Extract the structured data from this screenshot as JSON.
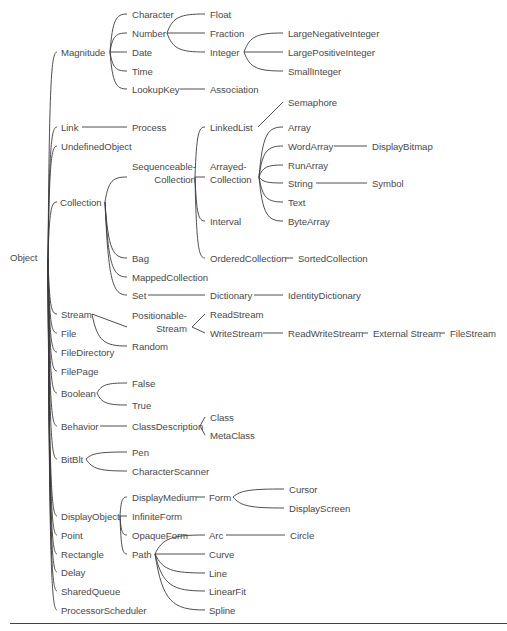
{
  "diagram": {
    "root": "Object",
    "line_color": "#3a3a3a",
    "text_color": "#4a4a4a",
    "nodes": [
      {
        "id": "Object",
        "label": "Object",
        "x": 10,
        "y": 252,
        "ax": 46,
        "ay": 258
      },
      {
        "id": "Magnitude",
        "label": "Magnitude",
        "x": 61,
        "y": 47,
        "lx": 58,
        "rx": 108,
        "ay": 52
      },
      {
        "id": "Character",
        "label": "Character",
        "x": 132,
        "y": 9,
        "lx": 128,
        "rx": 176,
        "ay": 14
      },
      {
        "id": "Number",
        "label": "Number",
        "x": 132,
        "y": 28,
        "lx": 128,
        "rx": 165,
        "ay": 33
      },
      {
        "id": "Date",
        "label": "Date",
        "x": 132,
        "y": 47,
        "lx": 128,
        "rx": 152,
        "ay": 52
      },
      {
        "id": "Time",
        "label": "Time",
        "x": 132,
        "y": 66,
        "lx": 128,
        "rx": 152,
        "ay": 71
      },
      {
        "id": "LookupKey",
        "label": "LookupKey",
        "x": 132,
        "y": 84,
        "lx": 128,
        "rx": 178,
        "ay": 89
      },
      {
        "id": "Float",
        "label": "Float",
        "x": 210,
        "y": 9,
        "lx": 206,
        "rx": 236,
        "ay": 14
      },
      {
        "id": "Fraction",
        "label": "Fraction",
        "x": 210,
        "y": 28,
        "lx": 206,
        "rx": 245,
        "ay": 33
      },
      {
        "id": "Integer",
        "label": "Integer",
        "x": 210,
        "y": 47,
        "lx": 206,
        "rx": 242,
        "ay": 52
      },
      {
        "id": "Association",
        "label": "Association",
        "x": 210,
        "y": 84,
        "lx": 206,
        "rx": 258,
        "ay": 89
      },
      {
        "id": "LargeNegativeInteger",
        "label": "LargeNegativeInteger",
        "x": 288,
        "y": 28,
        "lx": 284,
        "rx": 380,
        "ay": 33
      },
      {
        "id": "LargePositiveInteger",
        "label": "LargePositiveInteger",
        "x": 288,
        "y": 47,
        "lx": 284,
        "rx": 380,
        "ay": 52
      },
      {
        "id": "SmallInteger",
        "label": "SmallInteger",
        "x": 288,
        "y": 66,
        "lx": 284,
        "rx": 340,
        "ay": 71
      },
      {
        "id": "Link",
        "label": "Link",
        "x": 61,
        "y": 122,
        "lx": 58,
        "rx": 80,
        "ay": 127
      },
      {
        "id": "Process",
        "label": "Process",
        "x": 132,
        "y": 122,
        "lx": 128,
        "rx": 165,
        "ay": 127
      },
      {
        "id": "UndefinedObject",
        "label": "UndefinedObject",
        "x": 61,
        "y": 141,
        "lx": 58,
        "rx": 130,
        "ay": 146
      },
      {
        "id": "Collection",
        "label": "Collection",
        "x": 60,
        "y": 197,
        "lx": 58,
        "rx": 103,
        "ay": 202
      },
      {
        "id": "SequenceableCollection",
        "label": "Sequenceable-",
        "label2": "Collection",
        "x": 132,
        "y": 160,
        "lx": 128,
        "rx": 193,
        "ay": 177,
        "two": true,
        "align2": "right"
      },
      {
        "id": "Bag",
        "label": "Bag",
        "x": 132,
        "y": 253,
        "lx": 128,
        "rx": 148,
        "ay": 258
      },
      {
        "id": "MappedCollection",
        "label": "MappedCollection",
        "x": 132,
        "y": 272,
        "lx": 128,
        "rx": 205,
        "ay": 277
      },
      {
        "id": "Set",
        "label": "Set",
        "x": 132,
        "y": 290,
        "lx": 128,
        "rx": 146,
        "ay": 295
      },
      {
        "id": "LinkedList",
        "label": "LinkedList",
        "x": 210,
        "y": 122,
        "lx": 206,
        "rx": 256,
        "ay": 127
      },
      {
        "id": "ArrayedCollection",
        "label": "Arrayed-",
        "label2": "Collection",
        "x": 210,
        "y": 160,
        "lx": 206,
        "rx": 257,
        "ay": 177,
        "two": true,
        "align2": "right"
      },
      {
        "id": "Interval",
        "label": "Interval",
        "x": 210,
        "y": 216,
        "lx": 206,
        "rx": 242,
        "ay": 221
      },
      {
        "id": "OrderedCollection",
        "label": "OrderedCollection",
        "x": 210,
        "y": 253,
        "lx": 206,
        "rx": 283,
        "ay": 258
      },
      {
        "id": "Dictionary",
        "label": "Dictionary",
        "x": 210,
        "y": 290,
        "lx": 206,
        "rx": 252,
        "ay": 295
      },
      {
        "id": "Semaphore",
        "label": "Semaphore",
        "x": 288,
        "y": 97,
        "lx": 284,
        "rx": 335,
        "ay": 102
      },
      {
        "id": "Array",
        "label": "Array",
        "x": 288,
        "y": 122,
        "lx": 284,
        "rx": 310,
        "ay": 127
      },
      {
        "id": "WordArray",
        "label": "WordArray",
        "x": 288,
        "y": 141,
        "lx": 284,
        "rx": 332,
        "ay": 146
      },
      {
        "id": "RunArray",
        "label": "RunArray",
        "x": 288,
        "y": 160,
        "lx": 284,
        "rx": 326,
        "ay": 165
      },
      {
        "id": "String",
        "label": "String",
        "x": 288,
        "y": 178,
        "lx": 284,
        "rx": 314,
        "ay": 183
      },
      {
        "id": "Text",
        "label": "Text",
        "x": 288,
        "y": 197,
        "lx": 284,
        "rx": 306,
        "ay": 202
      },
      {
        "id": "ByteArray",
        "label": "ByteArray",
        "x": 288,
        "y": 216,
        "lx": 284,
        "rx": 330,
        "ay": 221
      },
      {
        "id": "SortedCollection",
        "label": "SortedCollection",
        "x": 298,
        "y": 253,
        "lx": 294,
        "rx": 368,
        "ay": 258
      },
      {
        "id": "IdentityDictionary",
        "label": "IdentityDictionary",
        "x": 288,
        "y": 290,
        "lx": 284,
        "rx": 366,
        "ay": 295
      },
      {
        "id": "DisplayBitmap",
        "label": "DisplayBitmap",
        "x": 372,
        "y": 141,
        "lx": 368,
        "rx": 430,
        "ay": 146
      },
      {
        "id": "Symbol",
        "label": "Symbol",
        "x": 372,
        "y": 178,
        "lx": 368,
        "rx": 402,
        "ay": 183
      },
      {
        "id": "Stream",
        "label": "Stream",
        "x": 61,
        "y": 309,
        "lx": 58,
        "rx": 90,
        "ay": 314
      },
      {
        "id": "PositionableStream",
        "label": "Positionable-",
        "label2": "Stream",
        "x": 132,
        "y": 309,
        "lx": 128,
        "rx": 190,
        "ay": 327,
        "two": true,
        "align2": "right"
      },
      {
        "id": "Random",
        "label": "Random",
        "x": 132,
        "y": 341,
        "lx": 128,
        "rx": 165,
        "ay": 346
      },
      {
        "id": "ReadStream",
        "label": "ReadStream",
        "x": 210,
        "y": 309,
        "lx": 206,
        "rx": 258,
        "ay": 314
      },
      {
        "id": "WriteStream",
        "label": "WriteStream",
        "x": 210,
        "y": 328,
        "lx": 206,
        "rx": 261,
        "ay": 333
      },
      {
        "id": "ReadWriteStream",
        "label": "ReadWriteStream",
        "x": 288,
        "y": 328,
        "lx": 284,
        "rx": 360,
        "ay": 333
      },
      {
        "id": "ExternalStream",
        "label": "External Stream",
        "x": 373,
        "y": 328,
        "lx": 369,
        "rx": 438,
        "ay": 333
      },
      {
        "id": "FileStream",
        "label": "FileStream",
        "x": 450,
        "y": 328,
        "lx": 446,
        "rx": 498,
        "ay": 333
      },
      {
        "id": "File",
        "label": "File",
        "x": 61,
        "y": 328,
        "lx": 58,
        "rx": 76,
        "ay": 333
      },
      {
        "id": "FileDirectory",
        "label": "FileDirectory",
        "x": 61,
        "y": 347,
        "lx": 58,
        "rx": 116,
        "ay": 352
      },
      {
        "id": "FilePage",
        "label": "FilePage",
        "x": 61,
        "y": 366,
        "lx": 58,
        "rx": 98,
        "ay": 371
      },
      {
        "id": "Boolean",
        "label": "Boolean",
        "x": 61,
        "y": 388,
        "lx": 58,
        "rx": 95,
        "ay": 393
      },
      {
        "id": "False",
        "label": "False",
        "x": 132,
        "y": 378,
        "lx": 128,
        "rx": 152,
        "ay": 383
      },
      {
        "id": "True",
        "label": "True",
        "x": 132,
        "y": 400,
        "lx": 128,
        "rx": 150,
        "ay": 405
      },
      {
        "id": "Behavior",
        "label": "Behavior",
        "x": 61,
        "y": 421,
        "lx": 58,
        "rx": 98,
        "ay": 426
      },
      {
        "id": "ClassDescription",
        "label": "ClassDescription",
        "x": 132,
        "y": 421,
        "lx": 128,
        "rx": 198,
        "ay": 426
      },
      {
        "id": "Class",
        "label": "Class",
        "x": 210,
        "y": 412,
        "lx": 206,
        "rx": 232,
        "ay": 417
      },
      {
        "id": "MetaClass",
        "label": "MetaClass",
        "x": 210,
        "y": 430,
        "lx": 206,
        "rx": 252,
        "ay": 435
      },
      {
        "id": "BitBlt",
        "label": "BitBlt",
        "x": 61,
        "y": 454,
        "lx": 58,
        "rx": 84,
        "ay": 459
      },
      {
        "id": "Pen",
        "label": "Pen",
        "x": 132,
        "y": 447,
        "lx": 128,
        "rx": 148,
        "ay": 452
      },
      {
        "id": "CharacterScanner",
        "label": "CharacterScanner",
        "x": 132,
        "y": 466,
        "lx": 128,
        "rx": 202,
        "ay": 471
      },
      {
        "id": "DisplayObject",
        "label": "DisplayObject",
        "x": 61,
        "y": 511,
        "lx": 58,
        "rx": 118,
        "ay": 516
      },
      {
        "id": "DisplayMedium",
        "label": "DisplayMedium",
        "x": 132,
        "y": 492,
        "lx": 128,
        "rx": 194,
        "ay": 497
      },
      {
        "id": "InfiniteForm",
        "label": "InfiniteForm",
        "x": 132,
        "y": 511,
        "lx": 128,
        "rx": 180,
        "ay": 516
      },
      {
        "id": "OpaqueForm",
        "label": "OpaqueForm",
        "x": 132,
        "y": 530,
        "lx": 128,
        "rx": 184,
        "ay": 535
      },
      {
        "id": "Path",
        "label": "Path",
        "x": 132,
        "y": 549,
        "lx": 128,
        "rx": 153,
        "ay": 554
      },
      {
        "id": "Form",
        "label": "Form",
        "x": 209,
        "y": 492,
        "lx": 206,
        "rx": 231,
        "ay": 497
      },
      {
        "id": "Cursor",
        "label": "Cursor",
        "x": 289,
        "y": 484,
        "lx": 285,
        "rx": 316,
        "ay": 489
      },
      {
        "id": "DisplayScreen",
        "label": "DisplayScreen",
        "x": 289,
        "y": 503,
        "lx": 285,
        "rx": 348,
        "ay": 508
      },
      {
        "id": "Arc",
        "label": "Arc",
        "x": 209,
        "y": 530,
        "lx": 206,
        "rx": 224,
        "ay": 535
      },
      {
        "id": "Circle",
        "label": "Circle",
        "x": 290,
        "y": 530,
        "lx": 286,
        "rx": 314,
        "ay": 535
      },
      {
        "id": "Curve",
        "label": "Curve",
        "x": 209,
        "y": 549,
        "lx": 206,
        "rx": 234,
        "ay": 554
      },
      {
        "id": "Line",
        "label": "Line",
        "x": 209,
        "y": 568,
        "lx": 206,
        "rx": 226,
        "ay": 573
      },
      {
        "id": "LinearFit",
        "label": "LinearFit",
        "x": 209,
        "y": 586,
        "lx": 206,
        "rx": 248,
        "ay": 591
      },
      {
        "id": "Spline",
        "label": "Spline",
        "x": 209,
        "y": 605,
        "lx": 206,
        "rx": 236,
        "ay": 610
      },
      {
        "id": "Point",
        "label": "Point",
        "x": 61,
        "y": 530,
        "lx": 58,
        "rx": 84,
        "ay": 535
      },
      {
        "id": "Rectangle",
        "label": "Rectangle",
        "x": 61,
        "y": 549,
        "lx": 58,
        "rx": 104,
        "ay": 554
      },
      {
        "id": "Delay",
        "label": "Delay",
        "x": 61,
        "y": 567,
        "lx": 58,
        "rx": 84,
        "ay": 572
      },
      {
        "id": "SharedQueue",
        "label": "SharedQueue",
        "x": 61,
        "y": 586,
        "lx": 58,
        "rx": 115,
        "ay": 591
      },
      {
        "id": "ProcessorScheduler",
        "label": "ProcessorScheduler",
        "x": 61,
        "y": 605,
        "lx": 58,
        "rx": 145,
        "ay": 610
      }
    ],
    "edges": [
      [
        "Object",
        "Magnitude",
        "curve"
      ],
      [
        "Object",
        "Link",
        "curve"
      ],
      [
        "Object",
        "UndefinedObject",
        "curve"
      ],
      [
        "Object",
        "Collection",
        "curve"
      ],
      [
        "Object",
        "Stream",
        "curve"
      ],
      [
        "Object",
        "File",
        "curve"
      ],
      [
        "Object",
        "FileDirectory",
        "curve"
      ],
      [
        "Object",
        "FilePage",
        "curve"
      ],
      [
        "Object",
        "Boolean",
        "curve"
      ],
      [
        "Object",
        "Behavior",
        "curve"
      ],
      [
        "Object",
        "BitBlt",
        "curve"
      ],
      [
        "Object",
        "DisplayObject",
        "curve"
      ],
      [
        "Object",
        "Point",
        "curve"
      ],
      [
        "Object",
        "Rectangle",
        "curve"
      ],
      [
        "Object",
        "Delay",
        "curve"
      ],
      [
        "Object",
        "SharedQueue",
        "curve"
      ],
      [
        "Object",
        "ProcessorScheduler",
        "curve"
      ],
      [
        "Magnitude",
        "Character",
        "curve"
      ],
      [
        "Magnitude",
        "Number",
        "curve"
      ],
      [
        "Magnitude",
        "Date",
        "curve"
      ],
      [
        "Magnitude",
        "Time",
        "curve"
      ],
      [
        "Magnitude",
        "LookupKey",
        "curve"
      ],
      [
        "Number",
        "Float",
        "curve"
      ],
      [
        "Number",
        "Fraction",
        "curve"
      ],
      [
        "Number",
        "Integer",
        "curve"
      ],
      [
        "Integer",
        "LargeNegativeInteger",
        "curve"
      ],
      [
        "Integer",
        "LargePositiveInteger",
        "curve"
      ],
      [
        "Integer",
        "SmallInteger",
        "curve"
      ],
      [
        "LookupKey",
        "Association",
        "line"
      ],
      [
        "Link",
        "Process",
        "line"
      ],
      [
        "Collection",
        "SequenceableCollection",
        "curve"
      ],
      [
        "Collection",
        "Bag",
        "curve"
      ],
      [
        "Collection",
        "MappedCollection",
        "curve"
      ],
      [
        "Collection",
        "Set",
        "curve"
      ],
      [
        "SequenceableCollection",
        "LinkedList",
        "curve"
      ],
      [
        "SequenceableCollection",
        "ArrayedCollection",
        "curve"
      ],
      [
        "SequenceableCollection",
        "Interval",
        "curve"
      ],
      [
        "SequenceableCollection",
        "OrderedCollection",
        "curve"
      ],
      [
        "LinkedList",
        "Semaphore",
        "line"
      ],
      [
        "ArrayedCollection",
        "Array",
        "curve"
      ],
      [
        "ArrayedCollection",
        "WordArray",
        "curve"
      ],
      [
        "ArrayedCollection",
        "RunArray",
        "curve"
      ],
      [
        "ArrayedCollection",
        "String",
        "curve"
      ],
      [
        "ArrayedCollection",
        "Text",
        "curve"
      ],
      [
        "ArrayedCollection",
        "ByteArray",
        "curve"
      ],
      [
        "WordArray",
        "DisplayBitmap",
        "line"
      ],
      [
        "String",
        "Symbol",
        "line"
      ],
      [
        "OrderedCollection",
        "SortedCollection",
        "line"
      ],
      [
        "Set",
        "Dictionary",
        "line"
      ],
      [
        "Dictionary",
        "IdentityDictionary",
        "line"
      ],
      [
        "Stream",
        "PositionableStream",
        "line"
      ],
      [
        "Stream",
        "Random",
        "curve"
      ],
      [
        "PositionableStream",
        "ReadStream",
        "line"
      ],
      [
        "PositionableStream",
        "WriteStream",
        "line"
      ],
      [
        "WriteStream",
        "ReadWriteStream",
        "line"
      ],
      [
        "ReadWriteStream",
        "ExternalStream",
        "line"
      ],
      [
        "ExternalStream",
        "FileStream",
        "line"
      ],
      [
        "Boolean",
        "False",
        "curve"
      ],
      [
        "Boolean",
        "True",
        "curve"
      ],
      [
        "Behavior",
        "ClassDescription",
        "line"
      ],
      [
        "ClassDescription",
        "Class",
        "line"
      ],
      [
        "ClassDescription",
        "MetaClass",
        "line"
      ],
      [
        "BitBlt",
        "Pen",
        "curve"
      ],
      [
        "BitBlt",
        "CharacterScanner",
        "curve"
      ],
      [
        "DisplayObject",
        "DisplayMedium",
        "curve"
      ],
      [
        "DisplayObject",
        "InfiniteForm",
        "curve"
      ],
      [
        "DisplayObject",
        "OpaqueForm",
        "curve"
      ],
      [
        "DisplayObject",
        "Path",
        "curve"
      ],
      [
        "DisplayMedium",
        "Form",
        "line"
      ],
      [
        "Form",
        "Cursor",
        "curve"
      ],
      [
        "Form",
        "DisplayScreen",
        "curve"
      ],
      [
        "Path",
        "Arc",
        "curve"
      ],
      [
        "Path",
        "Curve",
        "curve"
      ],
      [
        "Path",
        "Line",
        "curve"
      ],
      [
        "Path",
        "LinearFit",
        "curve"
      ],
      [
        "Path",
        "Spline",
        "curve"
      ],
      [
        "Arc",
        "Circle",
        "line"
      ]
    ]
  }
}
